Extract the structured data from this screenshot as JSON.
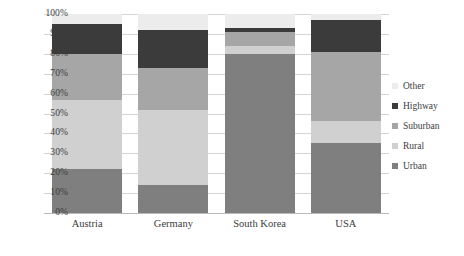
{
  "chart_data": {
    "type": "bar",
    "subtype": "stacked-percentage",
    "title": "",
    "xlabel": "",
    "ylabel": "",
    "ylim": [
      0,
      100
    ],
    "ytick_labels": [
      "100%",
      "90%",
      "80%",
      "70%",
      "60%",
      "50%",
      "40%",
      "30%",
      "20%",
      "10%",
      "0%"
    ],
    "ytick_values": [
      100,
      90,
      80,
      70,
      60,
      50,
      40,
      30,
      20,
      10,
      0
    ],
    "grid": true,
    "legend_position": "right",
    "categories": [
      "Austria",
      "Germany",
      "South Korea",
      "USA"
    ],
    "series": [
      {
        "name": "Urban",
        "color": "#7f7f7f",
        "values": [
          22,
          14,
          80,
          35
        ]
      },
      {
        "name": "Rural",
        "color": "#d0d0d0",
        "values": [
          35,
          38,
          4,
          11
        ]
      },
      {
        "name": "Suburban",
        "color": "#a6a6a6",
        "values": [
          23,
          21,
          7,
          35
        ]
      },
      {
        "name": "Highway",
        "color": "#3b3b3b",
        "values": [
          15,
          19,
          2,
          16
        ]
      },
      {
        "name": "Other",
        "color": "#ececec",
        "values": [
          5,
          8,
          7,
          3
        ]
      }
    ],
    "legend_entries": [
      {
        "label": "Other",
        "color": "#ececec"
      },
      {
        "label": "Highway",
        "color": "#3b3b3b"
      },
      {
        "label": "Suburban",
        "color": "#a6a6a6"
      },
      {
        "label": "Rural",
        "color": "#d0d0d0"
      },
      {
        "label": "Urban",
        "color": "#7f7f7f"
      }
    ]
  }
}
